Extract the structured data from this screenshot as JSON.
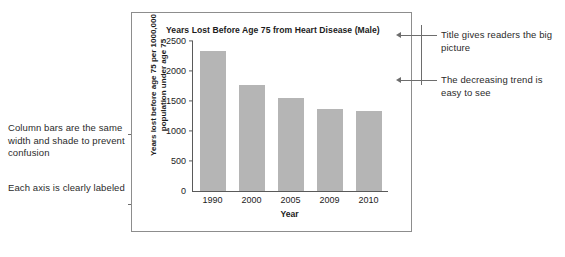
{
  "chart_data": {
    "type": "bar",
    "title": "Years Lost Before Age 75 from Heart Disease (Male)",
    "categories": [
      "1990",
      "2000",
      "2005",
      "2009",
      "2010"
    ],
    "values": [
      2340,
      1760,
      1550,
      1375,
      1340
    ],
    "xlabel": "Year",
    "ylabel_line1": "Years lost before age 75 per 1000,000",
    "ylabel_line2": "population under age 75",
    "ylim": [
      0,
      2500
    ],
    "yticks": [
      "2500",
      "2000",
      "1500",
      "1000",
      "500",
      "0"
    ],
    "ytick_values": [
      2500,
      2000,
      1500,
      1000,
      500,
      0
    ],
    "grid": false,
    "legend": "none",
    "bar_color": "#b5b5b5",
    "axis_color": "#5a5a5a"
  },
  "annotations": {
    "left_top": "Column bars are the same width and shade to prevent confusion",
    "left_bottom": "Each axis is clearly labeled",
    "right_top": "Title gives readers the big picture",
    "right_bottom": "The decreasing trend is easy to see"
  }
}
